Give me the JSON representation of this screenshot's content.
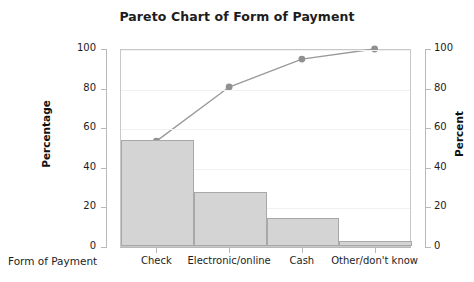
{
  "chart_data": {
    "type": "bar",
    "title": "Pareto Chart of Form of Payment",
    "xlabel": "Form of Payment",
    "ylabel": "Percentage",
    "y2label": "Percent",
    "categories": [
      "Check",
      "Electronic/online",
      "Cash",
      "Other/don't know"
    ],
    "values": [
      53.5,
      27.3,
      14.1,
      2.5
    ],
    "series": [
      {
        "name": "Percentage",
        "type": "bar",
        "values": [
          53.5,
          27.3,
          14.1,
          2.5
        ]
      },
      {
        "name": "Cumulative Percent",
        "type": "line",
        "values": [
          53.5,
          80.8,
          94.9,
          100.0
        ]
      }
    ],
    "ylim": [
      0,
      100
    ],
    "y2lim": [
      0,
      100
    ],
    "yticks": [
      0,
      20,
      40,
      60,
      80,
      100
    ],
    "y2ticks": [
      0,
      20,
      40,
      60,
      80,
      100
    ],
    "grid": true,
    "legend": "none",
    "colors": {
      "bar_fill": "#d4d4d4",
      "bar_edge": "#a8a8a8",
      "line": "#9a9a9a",
      "marker": "#909090",
      "text": "#1d1d1d",
      "axis": "#b9b9b9",
      "grid": "#f1f1f1",
      "background": "#ffffff"
    }
  },
  "axes": {
    "left_tick_labels": [
      "100",
      "80",
      "60",
      "40",
      "20",
      "0"
    ],
    "right_tick_labels": [
      "100",
      "80",
      "60",
      "40",
      "20",
      "0"
    ],
    "left_title": "Percentage",
    "right_title": "Percent",
    "x_title": "Form of Payment"
  },
  "title": "Pareto Chart of Form of Payment"
}
